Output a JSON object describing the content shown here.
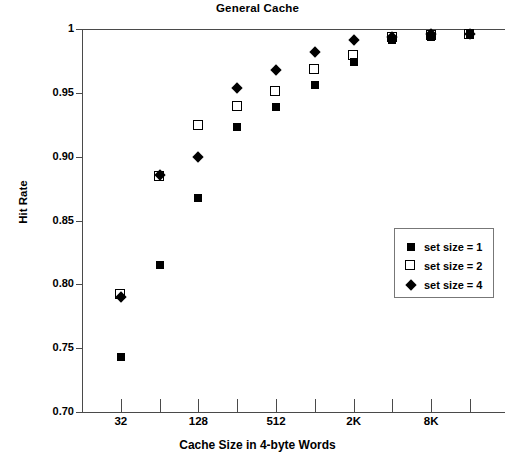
{
  "chart_data": {
    "type": "scatter",
    "title": "General Cache",
    "xlabel": "Cache Size in 4-byte Words",
    "ylabel": "Hit Rate",
    "ylim": [
      0.7,
      1.0
    ],
    "yticks": [
      "0.70",
      "0.75",
      "0.80",
      "0.85",
      "0.90",
      "0.95",
      "1"
    ],
    "ytick_values": [
      0.7,
      0.75,
      0.8,
      0.85,
      0.9,
      0.95,
      1.0
    ],
    "grid": false,
    "x_positions": [
      16,
      32,
      64,
      128,
      256,
      512,
      1024,
      2048,
      4096,
      8192,
      16384
    ],
    "xticks": [
      "",
      "32",
      "",
      "128",
      "",
      "512",
      "",
      "2K",
      "",
      "8K",
      ""
    ],
    "xtick_labels_shown": [
      "32",
      "128",
      "512",
      "2K",
      "8K"
    ],
    "legend_position": "right-middle",
    "series": [
      {
        "name": "set size = 1",
        "marker": "filled-square",
        "color": "#000000",
        "x": [
          32,
          64,
          128,
          256,
          512,
          1024,
          2048,
          4096,
          8192,
          16384
        ],
        "values": [
          0.743,
          0.815,
          0.868,
          0.923,
          0.939,
          0.956,
          0.974,
          0.991,
          0.994,
          0.996
        ]
      },
      {
        "name": "set size = 2",
        "marker": "open-square",
        "color": "#000000",
        "x": [
          32,
          64,
          128,
          256,
          512,
          1024,
          2048,
          4096,
          8192,
          16384
        ],
        "values": [
          0.792,
          0.884,
          0.924,
          0.939,
          0.951,
          0.968,
          0.979,
          0.993,
          0.995,
          0.996
        ]
      },
      {
        "name": "set size = 4",
        "marker": "filled-diamond",
        "color": "#000000",
        "x": [
          32,
          64,
          128,
          256,
          512,
          1024,
          2048,
          4096,
          8192,
          16384
        ],
        "values": [
          0.79,
          0.886,
          0.9,
          0.954,
          0.968,
          0.982,
          0.991,
          0.994,
          0.996,
          0.996
        ]
      }
    ]
  },
  "legend": {
    "items": [
      {
        "label": "set size = 1",
        "marker": "filled-square"
      },
      {
        "label": "set size = 2",
        "marker": "open-square"
      },
      {
        "label": "set size = 4",
        "marker": "filled-diamond"
      }
    ]
  }
}
